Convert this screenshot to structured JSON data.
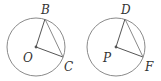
{
  "figures": [
    {
      "name": "left-circle",
      "center": {
        "label": "O",
        "x": 36,
        "y": 47
      },
      "radius": 29,
      "points": [
        {
          "label": "B",
          "x": 45,
          "y": 19,
          "lx": 41,
          "ly": 14
        },
        {
          "label": "C",
          "x": 63,
          "y": 57,
          "lx": 64,
          "ly": 71
        }
      ],
      "center_label_pos": {
        "lx": 23,
        "ly": 62
      }
    },
    {
      "name": "right-circle",
      "center": {
        "label": "P",
        "x": 116,
        "y": 47
      },
      "radius": 29,
      "points": [
        {
          "label": "D",
          "x": 125,
          "y": 19,
          "lx": 121,
          "ly": 14
        },
        {
          "label": "F",
          "x": 143,
          "y": 57,
          "lx": 145,
          "ly": 71
        }
      ],
      "center_label_pos": {
        "lx": 103,
        "ly": 62
      }
    }
  ],
  "labels": {
    "B": "B",
    "O": "O",
    "C": "C",
    "D": "D",
    "P": "P",
    "F": "F"
  }
}
